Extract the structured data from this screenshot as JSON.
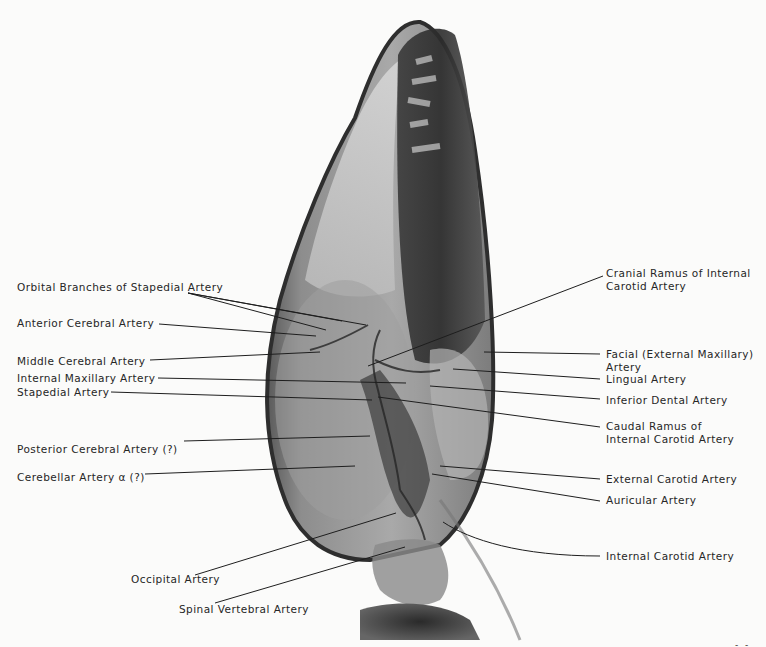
{
  "figure": {
    "type": "radiograph",
    "colors": {
      "background": "#fbfbfa",
      "text": "#262626",
      "leader_line": "#1e1e1e"
    }
  },
  "labels_left": [
    {
      "id": "orbital-branches",
      "text": "Orbital Branches of Stapedial Artery"
    },
    {
      "id": "anterior-cerebral",
      "text": "Anterior Cerebral Artery"
    },
    {
      "id": "middle-cerebral",
      "text": "Middle Cerebral Artery"
    },
    {
      "id": "internal-maxillary",
      "text": "Internal Maxillary Artery"
    },
    {
      "id": "stapedial",
      "text": "Stapedial Artery"
    },
    {
      "id": "posterior-cerebral",
      "text": "Posterior Cerebral Artery (?)"
    },
    {
      "id": "cerebellar-alpha",
      "text": "Cerebellar Artery α (?)"
    },
    {
      "id": "occipital",
      "text": "Occipital Artery"
    },
    {
      "id": "spinal-vertebral",
      "text": "Spinal Vertebral Artery"
    }
  ],
  "labels_right": [
    {
      "id": "cranial-ramus",
      "line1": "Cranial Ramus of Internal",
      "line2": "Carotid Artery"
    },
    {
      "id": "facial",
      "line1": "Facial (External Maxillary)",
      "line2": "Artery"
    },
    {
      "id": "lingual",
      "line1": "Lingual Artery"
    },
    {
      "id": "inferior-dental",
      "line1": "Inferior Dental Artery"
    },
    {
      "id": "caudal-ramus",
      "line1": "Caudal Ramus of",
      "line2": "Internal Carotid Artery"
    },
    {
      "id": "external-carotid",
      "line1": "External Carotid Artery"
    },
    {
      "id": "auricular",
      "line1": "Auricular Artery"
    },
    {
      "id": "internal-carotid",
      "line1": "Internal Carotid Artery"
    }
  ],
  "page_mark": "- -"
}
